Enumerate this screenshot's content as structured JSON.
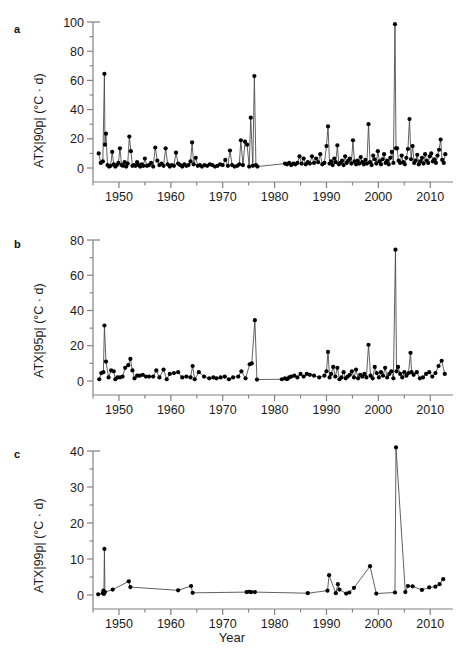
{
  "figure": {
    "panels": [
      {
        "label": "a",
        "ylabel": "ATX|90p| (°C · d)",
        "xlabel": ""
      },
      {
        "label": "b",
        "ylabel": "ATX|95p| (°C · d)",
        "xlabel": ""
      },
      {
        "label": "c",
        "ylabel": "ATX|99p| (°C · d)",
        "xlabel": "Year"
      }
    ],
    "xlabel": "Year",
    "marker_color": "#000000",
    "line_color": "#444444",
    "axis_color": "#808080"
  },
  "chart_data": [
    {
      "type": "line",
      "panel": "a",
      "title": "",
      "xlabel": "",
      "ylabel": "ATX|90p| (°C · d)",
      "xlim": [
        1945,
        2014
      ],
      "ylim": [
        0,
        100
      ],
      "yticks": [
        0,
        20,
        40,
        60,
        80,
        100
      ],
      "xticks": [
        1950,
        1960,
        1970,
        1980,
        1990,
        2000,
        2010
      ],
      "minor_yticks": [
        10,
        30,
        50,
        70,
        90
      ],
      "minor_xticks": [
        1945,
        1955,
        1965,
        1975,
        1985,
        1995,
        2005
      ],
      "grid": false,
      "legend": "none",
      "x": [
        1946.1,
        1946.5,
        1946.9,
        1947.2,
        1947.3,
        1947.5,
        1947.8,
        1948.1,
        1948.4,
        1948.7,
        1949.0,
        1949.3,
        1949.6,
        1949.9,
        1950.2,
        1950.5,
        1950.8,
        1951.1,
        1951.4,
        1951.7,
        1952.0,
        1952.3,
        1952.6,
        1952.9,
        1953.2,
        1953.5,
        1953.8,
        1954.1,
        1954.4,
        1954.7,
        1955.0,
        1955.4,
        1955.8,
        1956.2,
        1956.6,
        1957.0,
        1957.4,
        1957.8,
        1958.2,
        1958.6,
        1959.0,
        1959.4,
        1959.8,
        1960.2,
        1960.6,
        1961.0,
        1961.4,
        1961.8,
        1962.2,
        1962.6,
        1963.0,
        1963.4,
        1963.8,
        1964.1,
        1964.4,
        1964.8,
        1965.2,
        1965.6,
        1966.0,
        1966.5,
        1967.0,
        1967.5,
        1968.0,
        1968.5,
        1969.0,
        1969.5,
        1970.0,
        1970.5,
        1971.0,
        1971.4,
        1971.8,
        1972.3,
        1972.8,
        1973.2,
        1973.5,
        1973.9,
        1974.3,
        1974.7,
        1975.1,
        1975.4,
        1975.8,
        1976.1,
        1976.4,
        1976.7,
        1982.0,
        1982.4,
        1982.8,
        1983.2,
        1983.6,
        1984.0,
        1984.4,
        1984.8,
        1985.2,
        1985.6,
        1986.0,
        1986.4,
        1986.8,
        1987.2,
        1987.6,
        1988.0,
        1988.4,
        1988.8,
        1989.2,
        1989.6,
        1990.0,
        1990.3,
        1990.6,
        1990.9,
        1991.2,
        1991.5,
        1991.8,
        1992.1,
        1992.4,
        1992.7,
        1993.0,
        1993.3,
        1993.6,
        1993.9,
        1994.2,
        1994.5,
        1994.8,
        1995.1,
        1995.4,
        1995.7,
        1996.0,
        1996.3,
        1996.6,
        1996.9,
        1997.2,
        1997.5,
        1997.8,
        1998.1,
        1998.4,
        1998.7,
        1999.0,
        1999.3,
        1999.6,
        1999.9,
        2000.2,
        2000.5,
        2000.8,
        2001.1,
        2001.4,
        2001.7,
        2002.0,
        2002.3,
        2002.6,
        2002.9,
        2003.2,
        2003.4,
        2003.6,
        2003.9,
        2004.2,
        2004.5,
        2004.8,
        2005.1,
        2005.4,
        2005.7,
        2006.0,
        2006.3,
        2006.6,
        2006.9,
        2007.2,
        2007.5,
        2007.8,
        2008.1,
        2008.4,
        2008.7,
        2009.0,
        2009.3,
        2009.6,
        2009.9,
        2010.2,
        2010.5,
        2010.8,
        2011.1,
        2011.4,
        2011.7,
        2012.0,
        2012.3,
        2012.6,
        2012.9
      ],
      "y": [
        10.0,
        3.5,
        4.5,
        64.5,
        16.0,
        23.5,
        2.0,
        1.0,
        1.5,
        11.0,
        2.5,
        1.0,
        2.0,
        3.5,
        13.5,
        2.0,
        1.5,
        4.0,
        1.0,
        3.0,
        21.5,
        11.5,
        1.5,
        2.0,
        1.5,
        4.0,
        2.0,
        1.0,
        2.5,
        1.5,
        6.5,
        1.5,
        2.0,
        3.5,
        1.0,
        14.0,
        5.0,
        2.0,
        3.0,
        1.5,
        13.5,
        2.5,
        1.0,
        2.0,
        1.5,
        10.5,
        3.0,
        2.0,
        1.0,
        2.5,
        1.5,
        2.0,
        4.5,
        17.5,
        2.5,
        7.0,
        1.5,
        2.0,
        1.0,
        2.0,
        1.5,
        2.5,
        2.0,
        1.0,
        1.5,
        2.5,
        2.0,
        5.5,
        1.5,
        12.0,
        2.0,
        1.0,
        1.5,
        2.5,
        19.0,
        2.0,
        18.0,
        16.0,
        1.0,
        34.5,
        1.5,
        63.0,
        2.0,
        1.0,
        3.0,
        2.5,
        3.5,
        2.0,
        3.0,
        2.5,
        3.5,
        8.0,
        3.0,
        6.5,
        2.5,
        4.0,
        3.0,
        8.0,
        3.5,
        6.5,
        4.0,
        9.5,
        2.5,
        3.5,
        15.0,
        28.5,
        3.0,
        4.5,
        2.0,
        6.5,
        4.0,
        15.5,
        2.5,
        3.5,
        5.0,
        2.0,
        8.0,
        3.5,
        5.0,
        6.5,
        3.0,
        19.0,
        4.5,
        2.5,
        5.0,
        3.0,
        7.5,
        4.0,
        2.5,
        5.5,
        3.0,
        30.0,
        4.0,
        2.0,
        8.5,
        6.0,
        3.0,
        11.5,
        4.5,
        2.5,
        6.0,
        9.5,
        3.5,
        5.0,
        2.5,
        7.0,
        11.0,
        3.5,
        98.5,
        13.5,
        13.5,
        5.0,
        3.5,
        8.5,
        4.0,
        2.5,
        7.0,
        13.0,
        33.5,
        6.0,
        15.0,
        3.5,
        5.0,
        9.0,
        2.5,
        4.5,
        7.0,
        3.0,
        9.5,
        5.0,
        3.5,
        8.0,
        10.0,
        4.5,
        6.0,
        3.5,
        8.5,
        12.5,
        19.5,
        5.5,
        3.5,
        9.5
      ]
    },
    {
      "type": "line",
      "panel": "b",
      "title": "",
      "xlabel": "",
      "ylabel": "ATX|95p| (°C · d)",
      "xlim": [
        1945,
        2014
      ],
      "ylim": [
        0,
        80
      ],
      "yticks": [
        0,
        20,
        40,
        60,
        80
      ],
      "xticks": [
        1950,
        1960,
        1970,
        1980,
        1990,
        2000,
        2010
      ],
      "minor_yticks": [
        10,
        30,
        50,
        70
      ],
      "minor_xticks": [
        1945,
        1955,
        1965,
        1975,
        1985,
        1995,
        2005
      ],
      "grid": false,
      "legend": "none",
      "x": [
        1946.2,
        1946.6,
        1947.0,
        1947.2,
        1947.5,
        1948.0,
        1948.5,
        1949.0,
        1949.3,
        1949.7,
        1950.2,
        1950.7,
        1951.2,
        1951.8,
        1952.2,
        1952.6,
        1953.0,
        1953.5,
        1954.0,
        1954.6,
        1955.2,
        1955.8,
        1956.6,
        1957.2,
        1957.8,
        1958.6,
        1959.2,
        1959.8,
        1960.6,
        1961.4,
        1962.2,
        1963.0,
        1963.8,
        1964.2,
        1964.6,
        1965.4,
        1966.4,
        1967.4,
        1968.2,
        1968.8,
        1969.6,
        1970.4,
        1971.2,
        1972.0,
        1973.0,
        1973.6,
        1974.4,
        1975.2,
        1975.6,
        1976.2,
        1976.6,
        1981.4,
        1982.0,
        1982.4,
        1982.8,
        1983.2,
        1983.8,
        1984.4,
        1985.0,
        1985.6,
        1986.2,
        1986.8,
        1987.6,
        1988.6,
        1989.6,
        1990.0,
        1990.3,
        1990.6,
        1990.9,
        1991.3,
        1991.7,
        1992.1,
        1992.5,
        1992.9,
        1993.3,
        1993.7,
        1994.1,
        1994.5,
        1994.9,
        1995.3,
        1995.7,
        1996.1,
        1996.5,
        1996.9,
        1997.3,
        1997.7,
        1998.1,
        1998.5,
        1998.9,
        1999.3,
        1999.7,
        2000.1,
        2000.5,
        2000.9,
        2001.3,
        2001.7,
        2002.1,
        2002.5,
        2002.9,
        2003.3,
        2003.5,
        2003.8,
        2004.2,
        2004.6,
        2005.0,
        2005.4,
        2005.8,
        2006.2,
        2006.4,
        2006.8,
        2007.4,
        2008.0,
        2008.6,
        2009.2,
        2009.8,
        2010.4,
        2011.0,
        2011.6,
        2012.2,
        2012.8
      ],
      "y": [
        1.0,
        4.5,
        5.0,
        31.5,
        11.0,
        2.0,
        6.0,
        5.5,
        1.0,
        2.0,
        2.0,
        2.5,
        7.5,
        9.0,
        12.5,
        6.0,
        1.5,
        3.0,
        3.0,
        3.5,
        2.5,
        2.5,
        2.5,
        6.0,
        2.0,
        6.5,
        1.0,
        4.0,
        4.5,
        5.0,
        2.0,
        2.5,
        2.0,
        8.5,
        1.0,
        5.0,
        2.5,
        1.5,
        2.0,
        1.5,
        2.0,
        2.5,
        1.0,
        2.0,
        2.5,
        5.5,
        1.5,
        9.5,
        10.0,
        34.5,
        0.8,
        1.0,
        1.5,
        1.0,
        2.0,
        2.5,
        3.0,
        2.0,
        4.0,
        2.5,
        4.0,
        3.5,
        3.0,
        2.0,
        3.0,
        5.5,
        16.5,
        2.0,
        4.0,
        8.0,
        2.5,
        7.5,
        1.0,
        2.0,
        5.0,
        1.5,
        2.5,
        3.5,
        5.5,
        2.0,
        6.5,
        1.5,
        3.5,
        2.5,
        4.0,
        2.0,
        20.5,
        3.0,
        1.5,
        8.0,
        4.5,
        2.0,
        5.0,
        3.0,
        7.5,
        2.0,
        4.0,
        5.5,
        1.5,
        74.5,
        5.5,
        8.0,
        4.0,
        2.0,
        5.0,
        3.0,
        4.5,
        16.0,
        5.0,
        3.5,
        5.0,
        1.5,
        2.0,
        4.0,
        5.0,
        2.5,
        4.5,
        8.5,
        11.5,
        4.0
      ]
    },
    {
      "type": "line",
      "panel": "c",
      "title": "",
      "xlabel": "Year",
      "ylabel": "ATX|99p| (°C · d)",
      "xlim": [
        1945,
        2014
      ],
      "ylim": [
        0,
        40
      ],
      "yticks": [
        0,
        10,
        20,
        30,
        40
      ],
      "xticks": [
        1950,
        1960,
        1970,
        1980,
        1990,
        2000,
        2010
      ],
      "minor_yticks": [
        5,
        15,
        25,
        35
      ],
      "minor_xticks": [
        1945,
        1955,
        1965,
        1975,
        1985,
        1995,
        2005
      ],
      "grid": false,
      "legend": "none",
      "x": [
        1946.0,
        1946.9,
        1947.0,
        1947.1,
        1947.2,
        1947.3,
        1948.8,
        1951.9,
        1952.2,
        1961.4,
        1963.9,
        1964.2,
        1974.6,
        1975.1,
        1975.5,
        1976.2,
        1986.4,
        1990.2,
        1990.5,
        1991.8,
        1992.2,
        1992.5,
        1993.8,
        1994.4,
        1995.3,
        1998.4,
        1999.6,
        2003.2,
        2003.4,
        2005.2,
        2005.7,
        2006.6,
        2008.4,
        2009.8,
        2011.0,
        2011.8,
        2012.5
      ],
      "y": [
        0.2,
        0.5,
        1.2,
        0.3,
        12.8,
        0.8,
        1.5,
        3.8,
        2.2,
        1.3,
        2.5,
        0.6,
        0.8,
        0.9,
        0.8,
        0.8,
        0.5,
        1.2,
        5.5,
        0.5,
        3.0,
        1.5,
        0.4,
        0.7,
        2.0,
        8.0,
        0.4,
        0.7,
        41.0,
        0.8,
        2.5,
        2.4,
        1.4,
        2.1,
        2.3,
        3.0,
        4.4
      ]
    }
  ]
}
